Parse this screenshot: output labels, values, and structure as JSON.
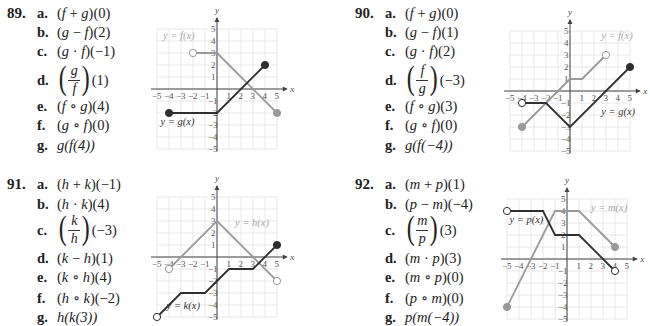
{
  "problems": [
    {
      "number": "89.",
      "parts": [
        {
          "label": "a.",
          "pre": "(",
          "f1": "f",
          "op": " + ",
          "f2": "g",
          "post": ")(0)"
        },
        {
          "label": "b.",
          "pre": "(",
          "f1": "g",
          "op": " − ",
          "f2": "f",
          "post": ")(2)"
        },
        {
          "label": "c.",
          "pre": "(",
          "f1": "g",
          "op": " · ",
          "f2": "f",
          "post": ")(−1)"
        },
        {
          "label": "d.",
          "fraction": true,
          "num": "g",
          "den": "f",
          "post": "(1)"
        },
        {
          "label": "e.",
          "pre": "(",
          "f1": "f",
          "op": " ∘ ",
          "f2": "g",
          "post": ")(4)"
        },
        {
          "label": "f.",
          "pre": "(",
          "f1": "g",
          "op": " ∘ ",
          "f2": "f",
          "post": ")(0)"
        },
        {
          "label": "g.",
          "text": "g(f(4))"
        }
      ],
      "graph": {
        "labels": {
          "gray": "y = f(x)",
          "dark": "y = g(x)"
        },
        "gray_path": [
          [
            -2,
            3
          ],
          [
            0,
            3
          ],
          [
            5,
            -2
          ]
        ],
        "gray_endpoints": [
          {
            "x": -2,
            "y": 3,
            "open": true
          },
          {
            "x": 5,
            "y": -2,
            "open": false
          }
        ],
        "dark_path": [
          [
            -4,
            -2
          ],
          [
            0,
            -2
          ],
          [
            4,
            2
          ]
        ],
        "dark_endpoints": [
          {
            "x": -4,
            "y": -2,
            "open": false
          },
          {
            "x": 4,
            "y": 2,
            "open": false
          }
        ]
      }
    },
    {
      "number": "90.",
      "parts": [
        {
          "label": "a.",
          "pre": "(",
          "f1": "f",
          "op": " + ",
          "f2": "g",
          "post": ")(0)"
        },
        {
          "label": "b.",
          "pre": "(",
          "f1": "g",
          "op": " − ",
          "f2": "f",
          "post": ")(1)"
        },
        {
          "label": "c.",
          "pre": "(",
          "f1": "g",
          "op": " · ",
          "f2": "f",
          "post": ")(2)"
        },
        {
          "label": "d.",
          "fraction": true,
          "num": "f",
          "den": "g",
          "post": "(−3)"
        },
        {
          "label": "e.",
          "pre": "(",
          "f1": "f",
          "op": " ∘ ",
          "f2": "g",
          "post": ")(3)"
        },
        {
          "label": "f.",
          "pre": "(",
          "f1": "g",
          "op": " ∘ ",
          "f2": "f",
          "post": ")(0)"
        },
        {
          "label": "g.",
          "text": "g(f(−4))"
        }
      ],
      "graph": {
        "labels": {
          "gray": "y = f(x)",
          "dark": "y = g(x)"
        },
        "gray_path": [
          [
            -4,
            -3
          ],
          [
            0,
            1
          ],
          [
            1,
            1
          ],
          [
            3,
            3
          ]
        ],
        "gray_endpoints": [
          {
            "x": -4,
            "y": -3,
            "open": false
          },
          {
            "x": 3,
            "y": 3,
            "open": true
          }
        ],
        "dark_path": [
          [
            -4,
            -1
          ],
          [
            -2,
            -1
          ],
          [
            0,
            -3
          ],
          [
            5,
            2
          ]
        ],
        "dark_endpoints": [
          {
            "x": -4,
            "y": -1,
            "open": true
          },
          {
            "x": 5,
            "y": 2,
            "open": false
          }
        ]
      }
    },
    {
      "number": "91.",
      "parts": [
        {
          "label": "a.",
          "pre": "(",
          "f1": "h",
          "op": " + ",
          "f2": "k",
          "post": ")(−1)"
        },
        {
          "label": "b.",
          "pre": "(",
          "f1": "h",
          "op": " · ",
          "f2": "k",
          "post": ")(4)"
        },
        {
          "label": "c.",
          "fraction": true,
          "num": "k",
          "den": "h",
          "post": "(−3)"
        },
        {
          "label": "d.",
          "pre": "(",
          "f1": "k",
          "op": " − ",
          "f2": "h",
          "post": ")(1)"
        },
        {
          "label": "e.",
          "pre": "(",
          "f1": "k",
          "op": " ∘ ",
          "f2": "h",
          "post": ")(4)"
        },
        {
          "label": "f.",
          "pre": "(",
          "f1": "h",
          "op": " ∘ ",
          "f2": "k",
          "post": ")(−2)"
        },
        {
          "label": "g.",
          "text": "h(k(3))"
        }
      ],
      "graph": {
        "labels": {
          "gray": "y = h(x)",
          "dark": "y = k(x)"
        },
        "gray_path": [
          [
            -4,
            -1
          ],
          [
            0,
            3
          ],
          [
            5,
            -2
          ]
        ],
        "gray_endpoints": [
          {
            "x": -4,
            "y": -1,
            "open": true
          },
          {
            "x": 5,
            "y": -2,
            "open": true
          }
        ],
        "dark_path": [
          [
            -5,
            -5
          ],
          [
            -3,
            -3
          ],
          [
            -1,
            -3
          ],
          [
            1,
            -1
          ],
          [
            3,
            -1
          ],
          [
            5,
            1
          ]
        ],
        "dark_endpoints": [
          {
            "x": -5,
            "y": -5,
            "open": true
          },
          {
            "x": 5,
            "y": 1,
            "open": false
          }
        ]
      }
    },
    {
      "number": "92.",
      "parts": [
        {
          "label": "a.",
          "pre": "(",
          "f1": "m",
          "op": " + ",
          "f2": "p",
          "post": ")(1)"
        },
        {
          "label": "b.",
          "pre": "(",
          "f1": "p",
          "op": " − ",
          "f2": "m",
          "post": ")(−4)"
        },
        {
          "label": "c.",
          "fraction": true,
          "num": "m",
          "den": "p",
          "post": "(3)"
        },
        {
          "label": "d.",
          "pre": "(",
          "f1": "m",
          "op": " · ",
          "f2": "p",
          "post": ")(3)"
        },
        {
          "label": "e.",
          "pre": "(",
          "f1": "m",
          "op": " ∘ ",
          "f2": "p",
          "post": ")(0)"
        },
        {
          "label": "f.",
          "pre": "(",
          "f1": "p",
          "op": " ∘ ",
          "f2": "m",
          "post": ")(0)"
        },
        {
          "label": "g.",
          "text": "p(m(−4))"
        }
      ],
      "graph": {
        "labels": {
          "gray": "y = m(x)",
          "dark": "y = p(x)"
        },
        "gray_path": [
          [
            -5,
            -4
          ],
          [
            -1,
            4
          ],
          [
            1,
            4
          ],
          [
            4,
            1
          ]
        ],
        "gray_endpoints": [
          {
            "x": -5,
            "y": -4,
            "open": false
          },
          {
            "x": 4,
            "y": 1,
            "open": false
          }
        ],
        "dark_path": [
          [
            -5,
            4
          ],
          [
            -2,
            4
          ],
          [
            -1,
            2
          ],
          [
            1,
            2
          ],
          [
            4,
            -1
          ]
        ],
        "dark_endpoints": [
          {
            "x": -5,
            "y": 4,
            "open": true
          },
          {
            "x": 4,
            "y": -1,
            "open": true
          }
        ]
      }
    }
  ],
  "axis": {
    "x_label": "x",
    "y_label": "y",
    "ticks": [
      "−5",
      "−4",
      "−3",
      "−2",
      "−1",
      "1",
      "2",
      "3",
      "4",
      "5"
    ]
  },
  "colors": {
    "gray_curve": "#9a9a9a",
    "dark_curve": "#2f2f2f",
    "grid": "#e2e2e2",
    "axis": "#444444",
    "label_gray": "#a8a8a8",
    "label_dark": "#333333"
  }
}
